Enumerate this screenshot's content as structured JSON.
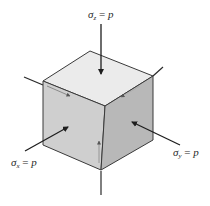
{
  "diagram": {
    "type": "stress-element-cube",
    "colors": {
      "top_face": "#ebebeb",
      "left_face": "#cfcfcf",
      "right_face": "#b8b8b8",
      "edge": "#3a3a3a",
      "arrow": "#1e1e1e",
      "text": "#2a2a2a"
    },
    "labels": {
      "sigma_z": {
        "symbol": "σ",
        "subscript": "z",
        "equals": " = ",
        "value": "p"
      },
      "sigma_x": {
        "symbol": "σ",
        "subscript": "x",
        "equals": " = ",
        "value": "p"
      },
      "sigma_y": {
        "symbol": "σ",
        "subscript": "y",
        "equals": " = ",
        "value": "p"
      }
    }
  }
}
